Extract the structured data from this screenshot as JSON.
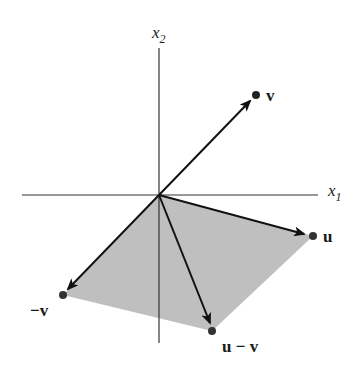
{
  "diagram": {
    "type": "vector-parallelogram",
    "axes": {
      "x1": {
        "label_base": "x",
        "label_sub": "1"
      },
      "x2": {
        "label_base": "x",
        "label_sub": "2"
      }
    },
    "vectors": [
      {
        "name": "v",
        "label": "v"
      },
      {
        "name": "u",
        "label": "u"
      },
      {
        "name": "neg-v",
        "label": "−v"
      },
      {
        "name": "u-minus-v",
        "label": "u − v"
      }
    ],
    "colors": {
      "region_fill": "#b8b8b8",
      "arrow": "#111111",
      "axis": "#333333",
      "point": "#222222"
    }
  }
}
